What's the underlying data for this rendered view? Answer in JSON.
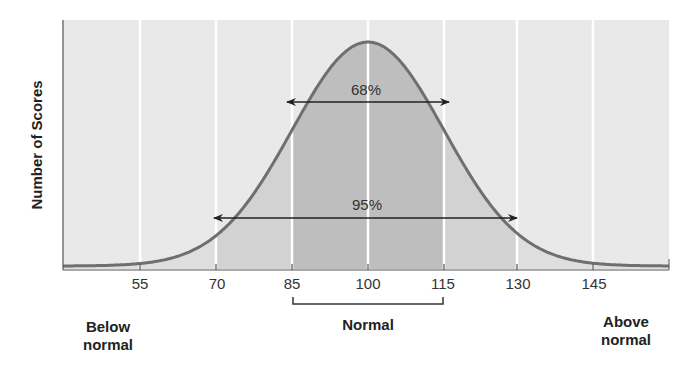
{
  "chart_data": {
    "type": "area",
    "title": "",
    "subtitle": "",
    "xlabel": "",
    "ylabel": "Number of Scores",
    "distribution": "normal",
    "mean": 100,
    "std_dev": 15,
    "x_ticks": [
      55,
      70,
      85,
      100,
      115,
      130,
      145
    ],
    "x_tick_labels": [
      "55",
      "70",
      "85",
      "100",
      "115",
      "130",
      "145"
    ],
    "xlim": [
      40,
      160
    ],
    "grid": {
      "vertical": true,
      "horizontal": false
    },
    "legend": null,
    "series": [
      {
        "name": "Distribution of IQ scores",
        "x": [
          40,
          55,
          70,
          85,
          100,
          115,
          130,
          145,
          160
        ],
        "relative_height": [
          0.003,
          0.044,
          0.135,
          0.607,
          1.0,
          0.607,
          0.135,
          0.044,
          0.003
        ]
      }
    ],
    "shaded_bands": [
      {
        "from": 85,
        "to": 115,
        "label": "68%",
        "shade": "#bdbdbd"
      },
      {
        "from": 70,
        "to": 130,
        "label": "95%",
        "shade": "#d0d0d0"
      }
    ],
    "annotations": [
      {
        "text": "68%",
        "type": "double-arrow",
        "from": 85,
        "to": 115
      },
      {
        "text": "95%",
        "type": "double-arrow",
        "from": 70,
        "to": 130
      },
      {
        "text": "Normal",
        "type": "bracket",
        "from": 85,
        "to": 115
      },
      {
        "text": "Below normal",
        "position": "bottom-left"
      },
      {
        "text": "Above normal",
        "position": "bottom-right"
      }
    ]
  },
  "labels": {
    "y_axis": "Number of Scores",
    "pct_68": "68%",
    "pct_95": "95%",
    "normal": "Normal",
    "below_line1": "Below",
    "below_line2": "normal",
    "above_line1": "Above",
    "above_line2": "normal",
    "ticks": [
      "55",
      "70",
      "85",
      "100",
      "115",
      "130",
      "145"
    ]
  },
  "colors": {
    "plot_bg": "#e9e9e9",
    "band_95": "#d2d2d2",
    "band_68": "#bebebe",
    "tail_fill": "#dddddd",
    "curve": "#6f6f6f",
    "grid": "#ffffff",
    "axis": "#555555",
    "text": "#222222"
  }
}
